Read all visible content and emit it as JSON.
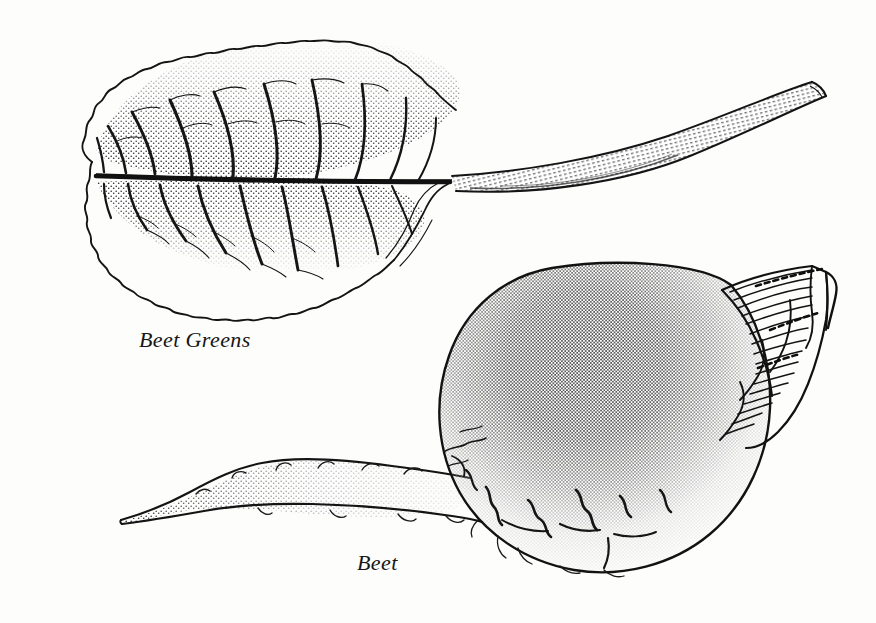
{
  "page": {
    "kind": "botanical-line-illustration",
    "width": 876,
    "height": 623,
    "background_color": "#fdfdfc",
    "ink_color": "#161616",
    "medium": "pen-and-ink stipple engraving"
  },
  "labels": {
    "greens": "Beet Greens",
    "beet": "Beet"
  },
  "figures": [
    {
      "name": "beet-greens",
      "description": "Single beet leaf with crinkled wavy margin, pinnate venation and long curving petiole rising to the upper right",
      "label": "Beet Greens"
    },
    {
      "name": "beet-root",
      "description": "Round beet bulb with dense stippled shading, cut stem bases at the right and a long tapering taproot extending to the left",
      "label": "Beet"
    }
  ],
  "bleed_through": {
    "note": "faint mirrored text showing through from the reverse page, illegible",
    "lines": [
      "the beet is a biennial",
      "grown for its swollen root",
      "available all year round",
      "choose firm smooth beets",
      "with fresh crisp greens",
      "store in the refrigerator",
      "cook whole to retain color"
    ]
  }
}
